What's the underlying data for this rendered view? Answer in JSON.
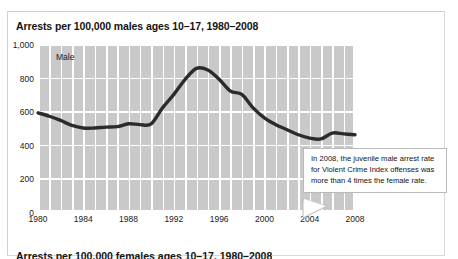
{
  "figure": {
    "title": "Arrests per 100,000 males ages 10–17, 1980–2008",
    "next_section_title": "Arrests per 100,000 females ages 10–17, 1980–2008",
    "series_label": "Male",
    "callout_text": "In 2008, the juvenile male arrest rate for Violent Crime Index offenses was more than 4 times the female rate.",
    "colors": {
      "plot_background": "#c9c9c9",
      "gridline": "#ffffff",
      "line": "#2b2b2b",
      "text": "#141414",
      "callout_border": "#b9b9b9",
      "frame": "#d9d9d9"
    }
  },
  "chart_data": {
    "type": "line",
    "title": "Arrests per 100,000 males ages 10–17, 1980–2008",
    "xlabel": "",
    "ylabel": "",
    "ylim": [
      0,
      1000
    ],
    "xlim": [
      1980,
      2008
    ],
    "yticks": [
      0,
      200,
      400,
      600,
      800,
      1000
    ],
    "ytick_labels": [
      "0",
      "200",
      "400",
      "600",
      "800",
      "1,000"
    ],
    "xticks": [
      1980,
      1984,
      1988,
      1992,
      1996,
      2000,
      2004,
      2008
    ],
    "xtick_labels": [
      "1980",
      "1984",
      "1988",
      "1992",
      "1996",
      "2000",
      "2004",
      "2008"
    ],
    "grid": true,
    "grid_vertical_every_year": true,
    "legend": "inline-label",
    "series": [
      {
        "name": "Male",
        "x": [
          1980,
          1981,
          1982,
          1983,
          1984,
          1985,
          1986,
          1987,
          1988,
          1989,
          1990,
          1991,
          1992,
          1993,
          1994,
          1995,
          1996,
          1997,
          1998,
          1999,
          2000,
          2001,
          2002,
          2003,
          2004,
          2005,
          2006,
          2007,
          2008
        ],
        "values": [
          590,
          570,
          545,
          515,
          500,
          500,
          505,
          508,
          525,
          520,
          525,
          620,
          700,
          790,
          855,
          845,
          790,
          720,
          700,
          620,
          560,
          520,
          490,
          460,
          440,
          435,
          470,
          465,
          460
        ]
      }
    ],
    "annotations": [
      {
        "text": "In 2008, the juvenile male arrest rate for Violent Crime Index offenses was more than 4 times the female rate.",
        "points_to_year": 2006
      }
    ]
  }
}
